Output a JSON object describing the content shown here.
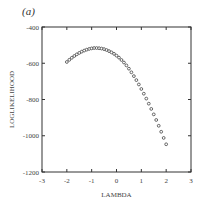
{
  "panel_label": "(a)",
  "chart_data": {
    "type": "scatter",
    "title": "",
    "xlabel": "LAMBDA",
    "ylabel": "LOGLIKELIHOOD",
    "xlim": [
      -3,
      3
    ],
    "ylim": [
      -1200,
      -400
    ],
    "xticks": [
      -3,
      -2,
      -1,
      0,
      1,
      2,
      3
    ],
    "yticks": [
      -400,
      -600,
      -800,
      -1000,
      -1200
    ],
    "xtick_labels": [
      "-3",
      "-2",
      "-1",
      "0",
      "1",
      "2",
      "3"
    ],
    "ytick_labels": [
      "-400",
      "-600",
      "-800",
      "-1000",
      "-1200"
    ],
    "grid": false,
    "legend": null,
    "marker": "open-circle",
    "series": [
      {
        "name": "profile log-likelihood",
        "x": [
          -2.0,
          -1.9,
          -1.8,
          -1.7,
          -1.6,
          -1.5,
          -1.4,
          -1.3,
          -1.2,
          -1.1,
          -1.0,
          -0.9,
          -0.8,
          -0.7,
          -0.6,
          -0.5,
          -0.4,
          -0.3,
          -0.2,
          -0.1,
          0.0,
          0.1,
          0.2,
          0.3,
          0.4,
          0.5,
          0.6,
          0.7,
          0.8,
          0.9,
          1.0,
          1.1,
          1.2,
          1.3,
          1.4,
          1.5,
          1.6,
          1.7,
          1.8,
          1.9,
          2.0
        ],
        "y": [
          -593,
          -581,
          -570,
          -560,
          -551,
          -543,
          -536,
          -530,
          -525,
          -521,
          -518,
          -516,
          -516,
          -517,
          -519,
          -522,
          -527,
          -533,
          -540,
          -548,
          -558,
          -569,
          -582,
          -596,
          -612,
          -630,
          -650,
          -671,
          -693,
          -717,
          -742,
          -768,
          -795,
          -823,
          -852,
          -882,
          -913,
          -945,
          -978,
          -1012,
          -1047
        ]
      }
    ]
  }
}
